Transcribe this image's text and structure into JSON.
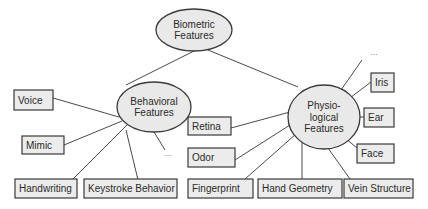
{
  "diagram": {
    "type": "taxonomy-tree",
    "root": {
      "id": "biometric",
      "lines": [
        "Biometric",
        "Features"
      ],
      "shape": "ellipse",
      "cx": 194,
      "cy": 30,
      "rx": 38,
      "ry": 21
    },
    "categories": [
      {
        "id": "behavioral",
        "lines": [
          "Behavioral",
          "Features"
        ],
        "shape": "ellipse",
        "cx": 154,
        "cy": 107,
        "rx": 37,
        "ry": 25,
        "children": [
          {
            "id": "voice",
            "label": "Voice",
            "x": 14,
            "y": 90,
            "w": 39,
            "h": 20
          },
          {
            "id": "mimic",
            "label": "Mimic",
            "x": 22,
            "y": 136,
            "w": 42,
            "h": 18
          },
          {
            "id": "handwriting",
            "label": "Handwriting",
            "x": 15,
            "y": 179,
            "w": 62,
            "h": 19
          },
          {
            "id": "keystroke",
            "label": "Keystroke Behavior",
            "x": 84,
            "y": 179,
            "w": 93,
            "h": 19
          }
        ],
        "more": {
          "label": "...",
          "x": 168,
          "y": 156
        }
      },
      {
        "id": "physiological",
        "lines": [
          "Physio-",
          "logical",
          "Features"
        ],
        "shape": "ellipse",
        "cx": 324,
        "cy": 117,
        "rx": 36,
        "ry": 32,
        "children": [
          {
            "id": "retina",
            "label": "Retina",
            "x": 188,
            "y": 117,
            "w": 43,
            "h": 18
          },
          {
            "id": "odor",
            "label": "Odor",
            "x": 188,
            "y": 148,
            "w": 47,
            "h": 19
          },
          {
            "id": "fingerprint",
            "label": "Fingerprint",
            "x": 188,
            "y": 179,
            "w": 65,
            "h": 19
          },
          {
            "id": "hand-geometry",
            "label": "Hand Geometry",
            "x": 258,
            "y": 179,
            "w": 84,
            "h": 19
          },
          {
            "id": "vein-structure",
            "label": "Vein Structure",
            "x": 344,
            "y": 179,
            "w": 69,
            "h": 19
          },
          {
            "id": "iris",
            "label": "Iris",
            "x": 371,
            "y": 73,
            "w": 23,
            "h": 19
          },
          {
            "id": "ear",
            "label": "Ear",
            "x": 364,
            "y": 108,
            "w": 30,
            "h": 19
          },
          {
            "id": "face",
            "label": "Face",
            "x": 357,
            "y": 144,
            "w": 37,
            "h": 19
          }
        ],
        "more": {
          "label": "...",
          "x": 374,
          "y": 55
        }
      }
    ],
    "edges": [
      {
        "from": "biometric",
        "to": "behavioral",
        "x1": 194,
        "y1": 51,
        "x2": 126,
        "y2": 85
      },
      {
        "from": "biometric",
        "to": "physiological",
        "x1": 208,
        "y1": 50,
        "x2": 298,
        "y2": 87
      },
      {
        "from": "behavioral",
        "to": "voice",
        "x1": 53,
        "y1": 98,
        "x2": 119,
        "y2": 117
      },
      {
        "from": "behavioral",
        "to": "mimic",
        "x1": 64,
        "y1": 145,
        "x2": 122,
        "y2": 121
      },
      {
        "from": "behavioral",
        "to": "handwriting",
        "x1": 73,
        "y1": 179,
        "x2": 128,
        "y2": 124
      },
      {
        "from": "behavioral",
        "to": "keystroke",
        "x1": 138,
        "y1": 180,
        "x2": 126,
        "y2": 130
      },
      {
        "from": "behavioral",
        "to": "more",
        "x1": 154,
        "y1": 132,
        "x2": 165,
        "y2": 150
      },
      {
        "from": "physiological",
        "to": "retina",
        "x1": 231,
        "y1": 128,
        "x2": 290,
        "y2": 112
      },
      {
        "from": "physiological",
        "to": "odor",
        "x1": 235,
        "y1": 160,
        "x2": 290,
        "y2": 125
      },
      {
        "from": "physiological",
        "to": "fingerprint",
        "x1": 245,
        "y1": 179,
        "x2": 296,
        "y2": 134
      },
      {
        "from": "physiological",
        "to": "hand-geometry",
        "x1": 302,
        "y1": 179,
        "x2": 302,
        "y2": 142
      },
      {
        "from": "physiological",
        "to": "vein-structure",
        "x1": 350,
        "y1": 179,
        "x2": 323,
        "y2": 141
      },
      {
        "from": "physiological",
        "to": "face",
        "x1": 357,
        "y1": 148,
        "x2": 332,
        "y2": 127
      },
      {
        "from": "physiological",
        "to": "ear",
        "x1": 364,
        "y1": 117,
        "x2": 336,
        "y2": 117
      },
      {
        "from": "physiological",
        "to": "iris",
        "x1": 371,
        "y1": 82,
        "x2": 338,
        "y2": 107
      },
      {
        "from": "physiological",
        "to": "more",
        "x1": 341,
        "y1": 90,
        "x2": 362,
        "y2": 60
      }
    ]
  },
  "colors": {
    "node_fill": "#ececec",
    "node_stroke": "#3a3a3a",
    "edge": "#4a4a4a",
    "text": "#2a2a2a",
    "background": "#ffffff"
  }
}
